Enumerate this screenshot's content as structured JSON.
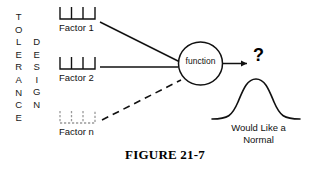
{
  "figure": {
    "caption": "FIGURE 21-7",
    "tolerance_label": "TOLERANCE",
    "design_label": "DESIGN",
    "function_label": "function",
    "question_mark": "?",
    "normal_caption_line1": "Would Like a",
    "normal_caption_line2": "Normal",
    "factors": [
      {
        "label": "Factor 1",
        "line_style": "solid"
      },
      {
        "label": "Factor 2",
        "line_style": "solid"
      },
      {
        "label": "Factor n",
        "line_style": "dashed"
      }
    ],
    "colors": {
      "background": "#ffffff",
      "ink": "#111111",
      "faint_ink": "#9a9a9a"
    }
  }
}
